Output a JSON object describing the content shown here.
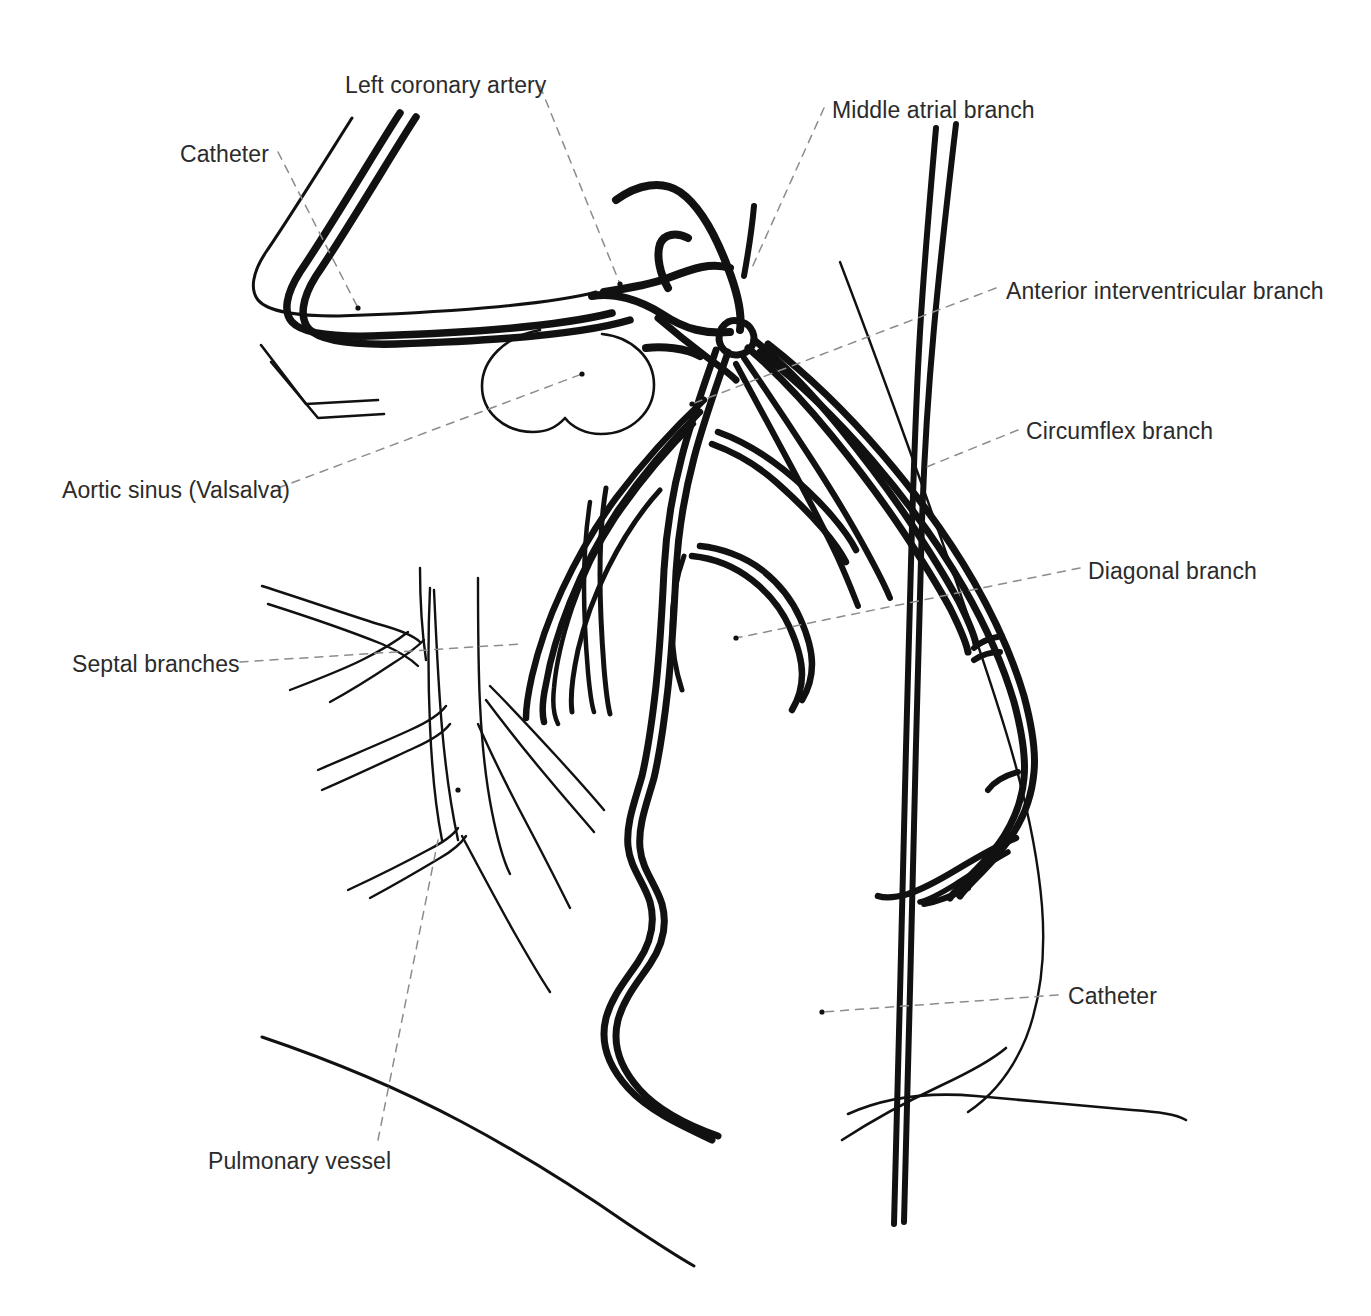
{
  "figure": {
    "kind": "line-drawing",
    "background_color": "#ffffff",
    "ink_color": "#111111",
    "label_color": "#2b2b2b",
    "leader_color": "#8c8c8c",
    "label_font_size_px": 23
  },
  "labels": [
    {
      "id": "catheter-top",
      "text": "Catheter",
      "x": 180,
      "y": 143,
      "align": "left"
    },
    {
      "id": "lca",
      "text": "Left coronary artery",
      "x": 345,
      "y": 74,
      "align": "left"
    },
    {
      "id": "middle-atrial",
      "text": "Middle atrial branch",
      "x": 832,
      "y": 99,
      "align": "left"
    },
    {
      "id": "aiv",
      "text": "Anterior interventricular branch",
      "x": 1006,
      "y": 280,
      "align": "left"
    },
    {
      "id": "circumflex",
      "text": "Circumflex branch",
      "x": 1026,
      "y": 420,
      "align": "left"
    },
    {
      "id": "diagonal",
      "text": "Diagonal branch",
      "x": 1088,
      "y": 560,
      "align": "left"
    },
    {
      "id": "aortic-sinus",
      "text": "Aortic sinus (Valsalva)",
      "x": 62,
      "y": 479,
      "align": "left"
    },
    {
      "id": "septal",
      "text": "Septal branches",
      "x": 72,
      "y": 653,
      "align": "left"
    },
    {
      "id": "catheter-lower",
      "text": "Catheter",
      "x": 1068,
      "y": 985,
      "align": "left"
    },
    {
      "id": "pulmonary",
      "text": "Pulmonary vessel",
      "x": 208,
      "y": 1150,
      "align": "left"
    }
  ],
  "structures": [
    {
      "id": "catheter-hook",
      "name": "Catheter (coronary hook)",
      "stroke": "thick-double"
    },
    {
      "id": "left-coronary-trunk",
      "name": "Left coronary artery trunk",
      "stroke": "thick"
    },
    {
      "id": "middle-atrial-branch",
      "name": "Middle atrial branch",
      "stroke": "thick"
    },
    {
      "id": "aiv-branch",
      "name": "Anterior interventricular branch",
      "stroke": "thick"
    },
    {
      "id": "circumflex-branch",
      "name": "Circumflex branch",
      "stroke": "thick"
    },
    {
      "id": "diagonal-branch",
      "name": "Diagonal branch",
      "stroke": "thick"
    },
    {
      "id": "septal-branches",
      "name": "Septal branches",
      "stroke": "thick"
    },
    {
      "id": "aortic-sinus-bulge",
      "name": "Aortic sinus of Valsalva",
      "stroke": "thin"
    },
    {
      "id": "pulmonary-tree",
      "name": "Pulmonary vessel tree",
      "stroke": "thin"
    },
    {
      "id": "catheter-shaft",
      "name": "Catheter shaft (descending)",
      "stroke": "thick-double"
    },
    {
      "id": "cardiac-border",
      "name": "Cardiac silhouette border",
      "stroke": "thin"
    },
    {
      "id": "diaphragm-line",
      "name": "Diaphragm outline",
      "stroke": "thin"
    }
  ]
}
